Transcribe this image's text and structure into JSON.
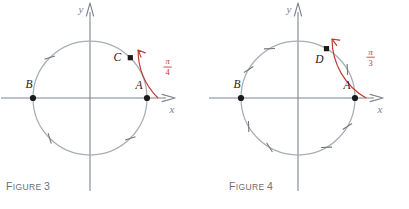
{
  "page": {
    "background": "#ffffff",
    "width": 409,
    "height": 209
  },
  "style": {
    "circle_color": "#a8adb4",
    "axis_color": "#7e838b",
    "tick_color": "#72777e",
    "point_color": "#1a1a1a",
    "arc_color": "#c0392b",
    "arc_label_color": "#c0392b",
    "label_color": "#1a1a1a",
    "caption_color": "#6e6e72"
  },
  "figures": [
    {
      "id": "figure-3",
      "caption_lead": "F",
      "caption_word": "IGURE",
      "caption_number": "3",
      "caption_full": "FIGURE 3",
      "axes": {
        "x_label": "x",
        "y_label": "y"
      },
      "circle": {
        "center_x": 90,
        "center_y": 98,
        "radius": 57
      },
      "points": [
        {
          "label": "A",
          "angle_deg": 0,
          "marker": "dot",
          "label_dx": -8,
          "label_dy": -9
        },
        {
          "label": "B",
          "angle_deg": 180,
          "marker": "dot",
          "label_dx": -4,
          "label_dy": -10
        },
        {
          "label": "C",
          "angle_deg": 45,
          "marker": "square",
          "label_dx": -13,
          "label_dy": 3
        }
      ],
      "ticks_deg": [
        135,
        225,
        315
      ],
      "arc": {
        "from_deg": 0,
        "to_deg": 45,
        "direction": "counterclockwise",
        "radius": 68,
        "numerator": "π",
        "denominator": "4",
        "label": "π/4"
      }
    },
    {
      "id": "figure-4",
      "caption_lead": "F",
      "caption_word": "IGURE",
      "caption_number": "4",
      "caption_full": "FIGURE 4",
      "axes": {
        "x_label": "x",
        "y_label": "y"
      },
      "circle": {
        "center_x": 94,
        "center_y": 98,
        "radius": 57
      },
      "points": [
        {
          "label": "A",
          "angle_deg": 0,
          "marker": "dot",
          "label_dx": -8,
          "label_dy": -9
        },
        {
          "label": "B",
          "angle_deg": 180,
          "marker": "dot",
          "label_dx": -4,
          "label_dy": -10
        },
        {
          "label": "D",
          "angle_deg": 60,
          "marker": "square",
          "label_dx": -7,
          "label_dy": 14
        }
      ],
      "ticks_deg": [
        30,
        120,
        150,
        210,
        240,
        300,
        330
      ],
      "arc": {
        "from_deg": 0,
        "to_deg": 60,
        "direction": "counterclockwise",
        "radius": 68,
        "numerator": "π",
        "denominator": "3",
        "label": "π/3"
      }
    }
  ]
}
